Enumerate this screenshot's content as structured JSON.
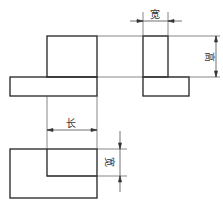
{
  "diagram": {
    "type": "three-view orthographic drawing",
    "views": [
      "front-view",
      "side-view",
      "top-view"
    ],
    "labels": {
      "width_top": "宽",
      "height": "高",
      "length": "长",
      "width_top_view": "宽"
    },
    "line_color": "#222222"
  }
}
